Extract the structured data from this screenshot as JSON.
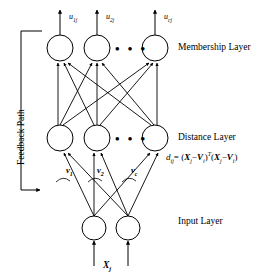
{
  "figure": {
    "width": 268,
    "height": 279,
    "background": "#ffffff",
    "stroke_color": "#000000"
  },
  "layers": {
    "membership": {
      "label": "Membership Layer",
      "nodes": [
        {
          "id": "m1",
          "cx": 60,
          "cy": 48,
          "r": 13
        },
        {
          "id": "m2",
          "cx": 97,
          "cy": 48,
          "r": 13
        },
        {
          "id": "mc",
          "cx": 155,
          "cy": 48,
          "r": 13
        }
      ],
      "ellipsis": "• • •",
      "outputs": [
        {
          "label": "u",
          "sub": "1j",
          "x": 69,
          "y": 16
        },
        {
          "label": "u",
          "sub": "2j",
          "x": 106,
          "y": 16
        },
        {
          "label": "u",
          "sub": "cj",
          "x": 164,
          "y": 16
        }
      ]
    },
    "distance": {
      "label": "Distance Layer",
      "formula": {
        "lhs": "d",
        "lhs_sub": "ij",
        "equals": "=",
        "text": "d_ij = (X_j − V_i)^T (X_j − V_i)",
        "term_x": "X",
        "term_x_sub": "j",
        "minus": "−",
        "term_v": "V",
        "term_v_sub": "i",
        "transpose": "T"
      },
      "nodes": [
        {
          "id": "d1",
          "cx": 60,
          "cy": 138,
          "r": 13
        },
        {
          "id": "d2",
          "cx": 97,
          "cy": 138,
          "r": 13
        },
        {
          "id": "dc",
          "cx": 155,
          "cy": 138,
          "r": 13
        }
      ],
      "ellipsis": "• • •",
      "weights": [
        {
          "label": "v",
          "sub": "1",
          "x": 66,
          "y": 170
        },
        {
          "label": "v",
          "sub": "2",
          "x": 97,
          "y": 170
        },
        {
          "label": "v",
          "sub": "c",
          "x": 131,
          "y": 170
        }
      ]
    },
    "input": {
      "label": "Input Layer",
      "nodes": [
        {
          "id": "i1",
          "cx": 94,
          "cy": 228,
          "r": 12
        },
        {
          "id": "i2",
          "cx": 128,
          "cy": 228,
          "r": 12
        }
      ],
      "signal": {
        "label": "X",
        "sub": "j",
        "x": 103,
        "y": 262
      }
    }
  },
  "feedback": {
    "label": "Feedback Path",
    "bracket": {
      "x": 21,
      "top": 31,
      "bottom": 190,
      "arm": 21
    }
  },
  "labels_positions": {
    "membership_layer_xy": [
      178,
      44
    ],
    "distance_layer_xy": [
      178,
      134
    ],
    "input_layer_xy": [
      178,
      218
    ],
    "formula_xy": [
      166,
      152
    ],
    "feedback_label_xy": [
      17,
      160
    ]
  }
}
